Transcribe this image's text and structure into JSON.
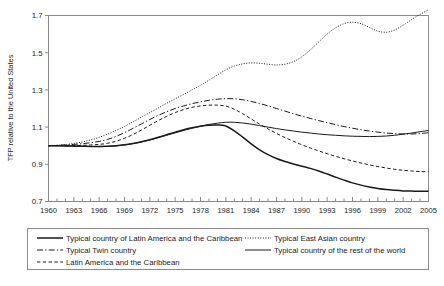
{
  "chart_data": {
    "type": "line",
    "title": "",
    "subtitle": "",
    "xlabel": "",
    "ylabel": "TFP relative to the United States",
    "xlim": [
      1960,
      2005
    ],
    "ylim": [
      0.7,
      1.7
    ],
    "yticks": [
      0.7,
      0.9,
      1.1,
      1.3,
      1.5,
      1.7
    ],
    "ytick_labels": [
      "0.7",
      "0.9",
      "1.1",
      "1.3",
      "1.5",
      "1.7"
    ],
    "xticks_labeled": [
      1960,
      1963,
      1966,
      1969,
      1972,
      1975,
      1978,
      1981,
      1984,
      1987,
      1990,
      1993,
      1996,
      1999,
      2002,
      2005
    ],
    "xtick_labels": [
      "1960",
      "1963",
      "1966",
      "1969",
      "1972",
      "1975",
      "1978",
      "1981",
      "1984",
      "1987",
      "1990",
      "1993",
      "1996",
      "1999",
      "2002",
      "2005"
    ],
    "xtick_interval_minor": 1,
    "grid": false,
    "legend_position": "below-plot",
    "x": [
      1960,
      1961,
      1962,
      1963,
      1964,
      1965,
      1966,
      1967,
      1968,
      1969,
      1970,
      1971,
      1972,
      1973,
      1974,
      1975,
      1976,
      1977,
      1978,
      1979,
      1980,
      1981,
      1982,
      1983,
      1984,
      1985,
      1986,
      1987,
      1988,
      1989,
      1990,
      1991,
      1992,
      1993,
      1994,
      1995,
      1996,
      1997,
      1998,
      1999,
      2000,
      2001,
      2002,
      2003,
      2004,
      2005
    ],
    "series": [
      {
        "name": "Typical country of Latin America and the Caribbean",
        "style": "solid",
        "width": "thick",
        "color": "#1a1a1a",
        "values": [
          1.0,
          1.0,
          0.999,
          0.998,
          0.997,
          0.996,
          0.996,
          0.997,
          1.0,
          1.005,
          1.012,
          1.021,
          1.032,
          1.045,
          1.059,
          1.073,
          1.086,
          1.097,
          1.105,
          1.11,
          1.111,
          1.106,
          1.08,
          1.046,
          1.01,
          0.978,
          0.952,
          0.931,
          0.915,
          0.902,
          0.89,
          0.878,
          0.864,
          0.848,
          0.831,
          0.815,
          0.8,
          0.788,
          0.778,
          0.77,
          0.764,
          0.76,
          0.757,
          0.756,
          0.755,
          0.755
        ]
      },
      {
        "name": "Typical Twin country",
        "style": "dash-dot",
        "width": "thin",
        "color": "#1a1a1a",
        "values": [
          1.0,
          1.002,
          1.004,
          1.007,
          1.011,
          1.016,
          1.023,
          1.034,
          1.05,
          1.07,
          1.093,
          1.117,
          1.141,
          1.163,
          1.183,
          1.2,
          1.214,
          1.226,
          1.236,
          1.244,
          1.25,
          1.253,
          1.252,
          1.247,
          1.238,
          1.227,
          1.214,
          1.2,
          1.186,
          1.172,
          1.159,
          1.147,
          1.135,
          1.124,
          1.113,
          1.103,
          1.094,
          1.086,
          1.079,
          1.073,
          1.068,
          1.065,
          1.063,
          1.063,
          1.065,
          1.07
        ]
      },
      {
        "name": "Latin America and the Caribbean",
        "style": "dashed",
        "width": "thin",
        "color": "#1a1a1a",
        "values": [
          1.0,
          1.0,
          1.0,
          1.001,
          1.002,
          1.004,
          1.007,
          1.013,
          1.024,
          1.04,
          1.06,
          1.084,
          1.11,
          1.135,
          1.158,
          1.178,
          1.194,
          1.206,
          1.214,
          1.218,
          1.218,
          1.213,
          1.196,
          1.172,
          1.144,
          1.116,
          1.09,
          1.066,
          1.044,
          1.024,
          1.005,
          0.988,
          0.972,
          0.957,
          0.943,
          0.93,
          0.918,
          0.907,
          0.897,
          0.888,
          0.88,
          0.873,
          0.868,
          0.864,
          0.861,
          0.86
        ]
      },
      {
        "name": "Typical East Asian country",
        "style": "dotted",
        "width": "thin",
        "color": "#1a1a1a",
        "values": [
          1.0,
          1.002,
          1.006,
          1.012,
          1.02,
          1.031,
          1.045,
          1.062,
          1.082,
          1.104,
          1.128,
          1.153,
          1.178,
          1.203,
          1.228,
          1.252,
          1.276,
          1.3,
          1.325,
          1.352,
          1.38,
          1.408,
          1.428,
          1.44,
          1.445,
          1.443,
          1.438,
          1.434,
          1.438,
          1.452,
          1.478,
          1.515,
          1.558,
          1.6,
          1.634,
          1.656,
          1.664,
          1.656,
          1.636,
          1.616,
          1.61,
          1.622,
          1.648,
          1.678,
          1.706,
          1.73
        ]
      },
      {
        "name": "Typical country of the rest of the world",
        "style": "solid",
        "width": "thin",
        "color": "#1a1a1a",
        "values": [
          1.0,
          1.0,
          0.999,
          0.998,
          0.997,
          0.996,
          0.995,
          0.996,
          0.999,
          1.004,
          1.011,
          1.02,
          1.031,
          1.043,
          1.056,
          1.069,
          1.082,
          1.094,
          1.105,
          1.114,
          1.121,
          1.126,
          1.126,
          1.122,
          1.116,
          1.108,
          1.1,
          1.092,
          1.085,
          1.079,
          1.073,
          1.068,
          1.063,
          1.059,
          1.056,
          1.053,
          1.051,
          1.05,
          1.049,
          1.05,
          1.052,
          1.056,
          1.062,
          1.068,
          1.075,
          1.082
        ]
      }
    ]
  },
  "axis": {
    "ylabel": "TFP relative to the United States",
    "ytick_labels": [
      "1.7",
      "1.5",
      "1.3",
      "1.1",
      "0.9",
      "0.7"
    ],
    "xtick_labels": [
      "1960",
      "1963",
      "1966",
      "1969",
      "1972",
      "1975",
      "1978",
      "1981",
      "1984",
      "1987",
      "1990",
      "1993",
      "1996",
      "1999",
      "2002",
      "2005"
    ]
  },
  "legend": {
    "left_column": [
      {
        "label": "Typical country of Latin America and the Caribbean",
        "style": "solid-thick"
      },
      {
        "label": "Typical Twin country",
        "style": "dash-dot"
      },
      {
        "label": "Latin America and the Caribbean",
        "style": "dashed"
      }
    ],
    "right_column": [
      {
        "label": "Typical East Asian country",
        "style": "dotted"
      },
      {
        "label": "Typical country of the rest of the world",
        "style": "solid-thin"
      }
    ]
  }
}
